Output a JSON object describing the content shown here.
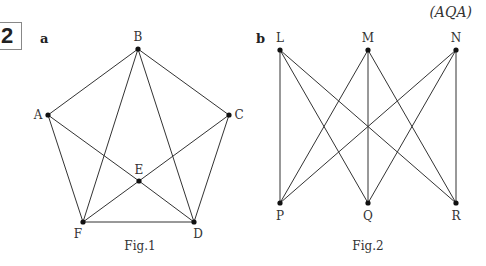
{
  "question_number": "2",
  "source": "(AQA)",
  "parts": [
    {
      "label": "a",
      "caption": "Fig.1",
      "vertices": [
        "A",
        "B",
        "C",
        "D",
        "E",
        "F"
      ],
      "edges": [
        [
          "A",
          "B"
        ],
        [
          "B",
          "C"
        ],
        [
          "C",
          "D"
        ],
        [
          "D",
          "F"
        ],
        [
          "F",
          "A"
        ],
        [
          "B",
          "F"
        ],
        [
          "B",
          "D"
        ],
        [
          "A",
          "E"
        ],
        [
          "E",
          "D"
        ],
        [
          "C",
          "E"
        ],
        [
          "E",
          "F"
        ]
      ]
    },
    {
      "label": "b",
      "caption": "Fig.2",
      "vertices": [
        "L",
        "M",
        "N",
        "P",
        "Q",
        "R"
      ],
      "edges": [
        [
          "L",
          "P"
        ],
        [
          "L",
          "Q"
        ],
        [
          "L",
          "R"
        ],
        [
          "M",
          "P"
        ],
        [
          "M",
          "Q"
        ],
        [
          "M",
          "R"
        ],
        [
          "N",
          "P"
        ],
        [
          "N",
          "Q"
        ],
        [
          "N",
          "R"
        ]
      ]
    }
  ]
}
